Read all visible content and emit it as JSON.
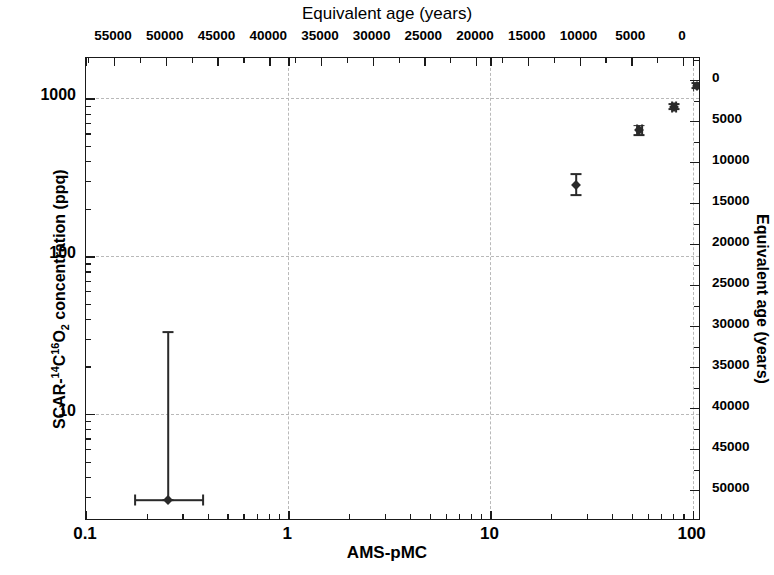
{
  "chart_data": {
    "type": "scatter",
    "title": "",
    "xlabel": "AMS-pMC",
    "ylabel": "SCAR-14C16O2 concentration (ppq)",
    "top_axis_label": "Equivalent age (years)",
    "right_axis_label": "Equivalent age (years)",
    "xscale": "log",
    "yscale": "log",
    "xlim": [
      0.1,
      110
    ],
    "ylim": [
      2.1,
      1800
    ],
    "grid": true,
    "legend": "none",
    "x_ticks": [
      "0.1",
      "1",
      "10",
      "100"
    ],
    "x_tick_values": [
      0.1,
      1,
      10,
      100
    ],
    "y_ticks": [
      "10",
      "100",
      "1000"
    ],
    "y_tick_values": [
      10,
      100,
      1000
    ],
    "top_ticks": [
      "55000",
      "50000",
      "45000",
      "40000",
      "35000",
      "30000",
      "25000",
      "20000",
      "15000",
      "10000",
      "5000",
      "0"
    ],
    "top_tick_values": [
      55000,
      50000,
      45000,
      40000,
      35000,
      30000,
      25000,
      20000,
      15000,
      10000,
      5000,
      0
    ],
    "right_ticks": [
      "0",
      "5000",
      "10000",
      "15000",
      "20000",
      "25000",
      "30000",
      "35000",
      "40000",
      "45000",
      "50000"
    ],
    "right_tick_values": [
      0,
      5000,
      10000,
      15000,
      20000,
      25000,
      30000,
      35000,
      40000,
      45000,
      50000
    ],
    "series": [
      {
        "name": "SCAR measurements",
        "marker": "diamond",
        "color": "#2a2a2a",
        "points": [
          {
            "x": 0.255,
            "y": 2.85,
            "x_err_low": 0.175,
            "x_err_high": 0.38,
            "y_err_low": 2.85,
            "y_err_high": 33.0
          },
          {
            "x": 26.5,
            "y": 281,
            "x_err_low": 26.5,
            "x_err_high": 26.5,
            "y_err_low": 243,
            "y_err_high": 330
          },
          {
            "x": 54.5,
            "y": 627,
            "x_err_low": 53.0,
            "x_err_high": 56.0,
            "y_err_low": 585,
            "y_err_high": 672
          },
          {
            "x": 81.0,
            "y": 885,
            "x_err_low": 79.0,
            "x_err_high": 83.0,
            "y_err_low": 855,
            "y_err_high": 915
          },
          {
            "x": 105.0,
            "y": 1205,
            "x_err_low": 101.0,
            "x_err_high": 109.0,
            "y_err_low": 1160,
            "y_err_high": 1255
          }
        ]
      }
    ]
  },
  "axes": {
    "top": {
      "label": "Equivalent age (years)"
    },
    "bottom": {
      "label": "AMS-pMC"
    },
    "left": {
      "label_prefix": "SCAR-",
      "label_sup1": "14",
      "label_mid": "C",
      "label_sup2": "16",
      "label_o": "O",
      "label_sub": "2",
      "label_suffix": " concentration (ppq)"
    },
    "right": {
      "label": "Equivalent age (years)"
    }
  },
  "colors": {
    "frame": "#1a1a1a",
    "grid": "#b9b9b9",
    "marker": "#2a2a2a",
    "background": "#ffffff"
  }
}
